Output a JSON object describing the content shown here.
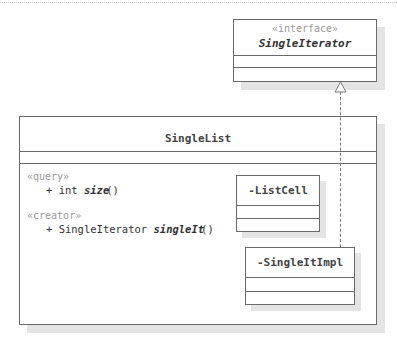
{
  "diagram": {
    "type": "UML class diagram",
    "interface_box": {
      "stereotype": "«interface»",
      "name": "SingleIterator"
    },
    "main_class": {
      "name": "SingleList",
      "operation_groups": [
        {
          "stereotype": "«query»",
          "operation": {
            "visibility": "+",
            "return_type": "int",
            "name": "size",
            "params": "()"
          }
        },
        {
          "stereotype": "«creator»",
          "operation": {
            "visibility": "+",
            "return_type": "SingleIterator",
            "name": "singleIt",
            "params": "()"
          }
        }
      ],
      "nested_classes": [
        {
          "name": "-ListCell"
        },
        {
          "name": "-SingleItImpl"
        }
      ]
    },
    "relationships": [
      {
        "type": "realization",
        "from": "-SingleItImpl",
        "to": "SingleIterator",
        "style": "dashed line with hollow triangle"
      }
    ],
    "colors": {
      "border": "#6a6a6a",
      "shadow": "#e4e4e4",
      "stereotype_text": "#9a9a9a"
    }
  }
}
